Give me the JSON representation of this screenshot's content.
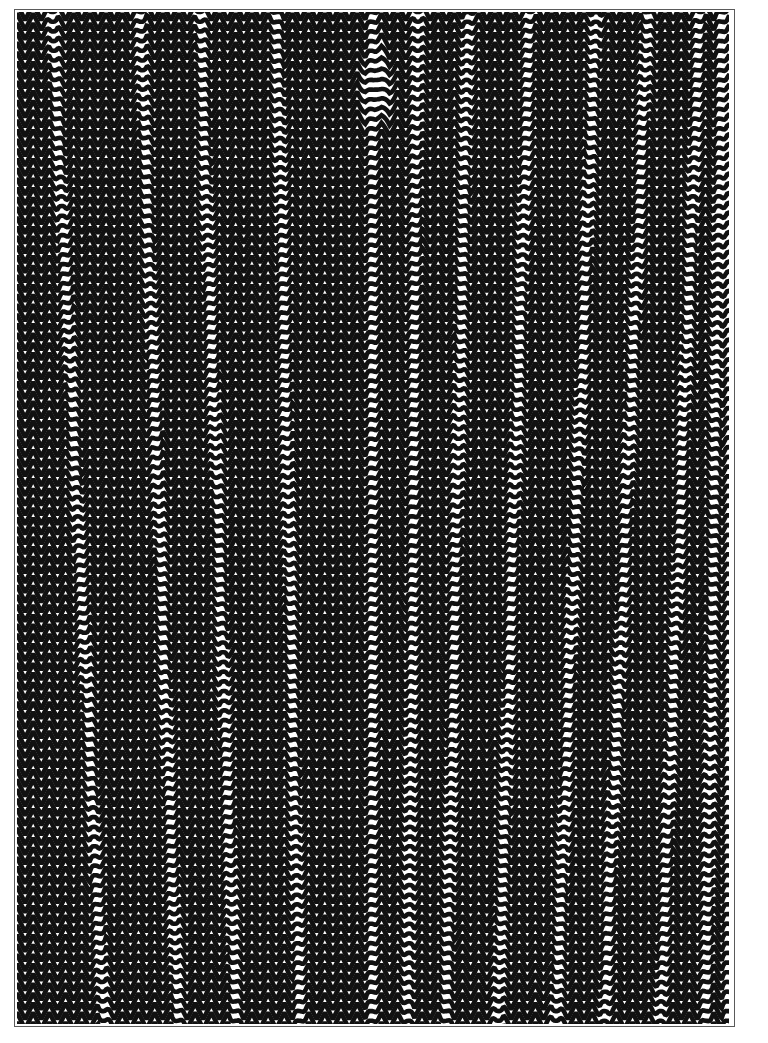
{
  "page": {
    "title": "Op-Art Zigzag Plate",
    "width": 768,
    "height": 1043,
    "background_color": "#ffffff"
  },
  "frame": {
    "label": "plate border",
    "left": 14,
    "top": 9,
    "width": 721,
    "height": 1018,
    "border_color": "#5a5a5a",
    "border_width": 1.2,
    "fill_color": "#ffffff"
  },
  "artwork": {
    "label": "zigzag moire field",
    "medium": "black ink on white ground",
    "style": "op-art chevron field",
    "ink_color": "#111111",
    "ground_color": "#ffffff",
    "left": 17,
    "top": 12,
    "width": 712,
    "height": 1012
  },
  "chart_data": {
    "type": "line",
    "subtitle": "Stacked triangular-wave (chevron) lines with phase-discontinuity seams",
    "xlabel": "",
    "ylabel": "",
    "grid": false,
    "legend": false,
    "xlim": [
      17,
      729
    ],
    "ylim": [
      12,
      1024
    ],
    "wave": {
      "waveform": "triangle",
      "horizontal_period_px": 16.2,
      "vertical_row_spacing_px": 9.7,
      "stroke_width_px": 4.6,
      "amplitude_px": 8.2,
      "row_count": 105,
      "phase_step_per_row_deg": 0,
      "orientation": "horizontal rows of vertical-pointing chevrons"
    },
    "seams": {
      "description": "near-vertical discontinuity lines where the triangular wave amplitude collapses and phase inverts",
      "count": 13,
      "top_x": [
        52,
        140,
        200,
        277,
        372,
        418,
        468,
        530,
        596,
        648,
        700,
        722,
        735
      ],
      "bottom_x": [
        104,
        178,
        236,
        300,
        372,
        408,
        446,
        498,
        556,
        604,
        660,
        706,
        728
      ],
      "collapse_half_width_px": 7
    },
    "node": {
      "description": "amplitude node where chevrons flatten into near-horizontal bars",
      "center_x": 376,
      "center_y": 88,
      "radius_x": 20,
      "radius_y": 52
    },
    "series": [
      {
        "name": "chevron rows",
        "values": [
          105
        ]
      }
    ]
  }
}
